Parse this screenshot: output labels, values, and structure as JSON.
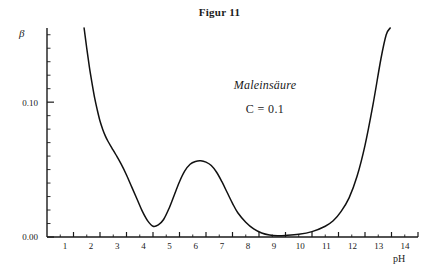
{
  "figure": {
    "title": "Figur 11"
  },
  "annotations": {
    "substance": "Maleinsäure",
    "concentration": "C = 0.1"
  },
  "axes": {
    "y_label": "β",
    "x_label": "pH",
    "y_tick_labels": [
      "0.10",
      "0.00"
    ],
    "x_tick_labels": [
      "1",
      "2",
      "3",
      "4",
      "5",
      "6",
      "7",
      "8",
      "9",
      "10",
      "11",
      "12",
      "13",
      "14"
    ]
  },
  "chart_data": {
    "type": "line",
    "title": "Figur 11",
    "xlabel": "pH",
    "ylabel": "β",
    "xlim": [
      0,
      14
    ],
    "ylim": [
      0.0,
      0.155
    ],
    "grid": false,
    "legend": null,
    "annotations": [
      "Maleinsäure",
      "C = 0.1"
    ],
    "xticks": [
      1,
      2,
      3,
      4,
      5,
      6,
      7,
      8,
      9,
      10,
      11,
      12,
      13,
      14
    ],
    "yticks": [
      0.0,
      0.1
    ],
    "series": [
      {
        "name": "Pufferkapazität β (Maleinsäure, C = 0.1)",
        "x": [
          1.4,
          1.5,
          1.6,
          1.7,
          1.8,
          1.9,
          2.0,
          2.1,
          2.2,
          2.3,
          2.45,
          2.6,
          2.8,
          3.0,
          3.2,
          3.4,
          3.6,
          3.8,
          4.0,
          4.2,
          4.4,
          4.6,
          4.8,
          5.0,
          5.2,
          5.4,
          5.6,
          5.8,
          6.0,
          6.2,
          6.4,
          6.6,
          6.8,
          7.0,
          7.2,
          7.5,
          7.8,
          8.1,
          8.4,
          8.7,
          9.0,
          9.5,
          10.0,
          10.5,
          10.8,
          11.1,
          11.4,
          11.7,
          12.0,
          12.3,
          12.6,
          12.8,
          12.95
        ],
        "y": [
          0.155,
          0.14,
          0.126,
          0.114,
          0.103,
          0.094,
          0.086,
          0.08,
          0.075,
          0.071,
          0.066,
          0.061,
          0.054,
          0.046,
          0.037,
          0.028,
          0.019,
          0.012,
          0.008,
          0.009,
          0.013,
          0.021,
          0.031,
          0.041,
          0.049,
          0.054,
          0.056,
          0.0565,
          0.0555,
          0.053,
          0.048,
          0.041,
          0.033,
          0.025,
          0.018,
          0.011,
          0.006,
          0.003,
          0.0015,
          0.001,
          0.0012,
          0.002,
          0.004,
          0.008,
          0.012,
          0.019,
          0.029,
          0.045,
          0.068,
          0.098,
          0.132,
          0.15,
          0.155
        ]
      }
    ]
  }
}
